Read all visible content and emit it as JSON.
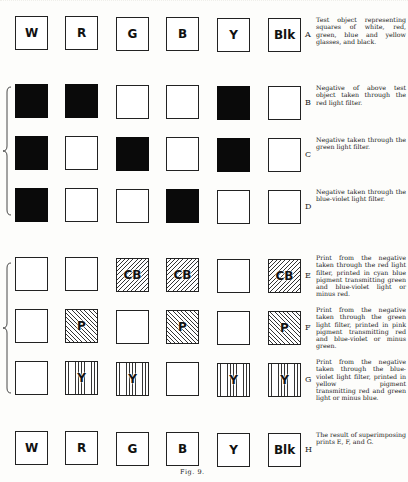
{
  "figure": {
    "caption": "Fig. 9.",
    "columns_x": [
      15,
      65,
      116,
      166,
      217,
      268
    ],
    "rows": [
      {
        "id": "A",
        "top": 16,
        "description": "Test object representing squares of white, red, green, blue and yellow glasses, and black.",
        "squares": [
          {
            "fill": "white",
            "label": "W"
          },
          {
            "fill": "white",
            "label": "R"
          },
          {
            "fill": "white",
            "label": "G"
          },
          {
            "fill": "white",
            "label": "B"
          },
          {
            "fill": "white",
            "label": "Y"
          },
          {
            "fill": "white",
            "label": "Blk"
          }
        ]
      },
      {
        "id": "B",
        "top": 84,
        "description": "Negative of above test object taken through the red light filter.",
        "squares": [
          {
            "fill": "black",
            "label": ""
          },
          {
            "fill": "black",
            "label": ""
          },
          {
            "fill": "white",
            "label": ""
          },
          {
            "fill": "white",
            "label": ""
          },
          {
            "fill": "black",
            "label": ""
          },
          {
            "fill": "white",
            "label": ""
          }
        ]
      },
      {
        "id": "C",
        "top": 136,
        "description": "Negative taken through the green light filter.",
        "squares": [
          {
            "fill": "black",
            "label": ""
          },
          {
            "fill": "white",
            "label": ""
          },
          {
            "fill": "black",
            "label": ""
          },
          {
            "fill": "white",
            "label": ""
          },
          {
            "fill": "black",
            "label": ""
          },
          {
            "fill": "white",
            "label": ""
          }
        ]
      },
      {
        "id": "D",
        "top": 188,
        "description": "Negative taken through the blue-violet light filter.",
        "squares": [
          {
            "fill": "black",
            "label": ""
          },
          {
            "fill": "white",
            "label": ""
          },
          {
            "fill": "white",
            "label": ""
          },
          {
            "fill": "black",
            "label": ""
          },
          {
            "fill": "white",
            "label": ""
          },
          {
            "fill": "white",
            "label": ""
          }
        ]
      },
      {
        "id": "E",
        "top": 257,
        "description": "Print from the negative taken through the red light filter, printed in cyan blue pigment transmitting green and blue-violet light or minus red.",
        "squares": [
          {
            "fill": "white",
            "label": ""
          },
          {
            "fill": "white",
            "label": ""
          },
          {
            "fill": "diag",
            "label": "CB"
          },
          {
            "fill": "diag",
            "label": "CB"
          },
          {
            "fill": "white",
            "label": ""
          },
          {
            "fill": "diag",
            "label": "CB"
          }
        ]
      },
      {
        "id": "F",
        "top": 309,
        "description": "Print from the negative taken through the green light filter, printed in pink pigment transmitting red and blue-violet or minus green.",
        "squares": [
          {
            "fill": "white",
            "label": ""
          },
          {
            "fill": "diag2",
            "label": "P"
          },
          {
            "fill": "white",
            "label": ""
          },
          {
            "fill": "diag2",
            "label": "P"
          },
          {
            "fill": "white",
            "label": ""
          },
          {
            "fill": "diag2",
            "label": "P"
          }
        ]
      },
      {
        "id": "G",
        "top": 361,
        "description": "Print from the negative taken through the blue-violet light filter, printed in yellow pigment transmitting red and green light or minus blue.",
        "squares": [
          {
            "fill": "white",
            "label": ""
          },
          {
            "fill": "vert",
            "label": "Y"
          },
          {
            "fill": "vert",
            "label": "Y"
          },
          {
            "fill": "white",
            "label": ""
          },
          {
            "fill": "vert",
            "label": "Y"
          },
          {
            "fill": "vert",
            "label": "Y"
          }
        ]
      },
      {
        "id": "H",
        "top": 431,
        "description": "The result of superimposing prints E, F, and G.",
        "squares": [
          {
            "fill": "white",
            "label": "W"
          },
          {
            "fill": "white",
            "label": "R"
          },
          {
            "fill": "white",
            "label": "G"
          },
          {
            "fill": "white",
            "label": "B"
          },
          {
            "fill": "white",
            "label": "Y"
          },
          {
            "fill": "white",
            "label": "Blk"
          }
        ]
      }
    ],
    "braces": [
      {
        "name": "negatives-brace",
        "top": 86,
        "height": 130
      },
      {
        "name": "prints-brace",
        "top": 262,
        "height": 132
      }
    ]
  }
}
